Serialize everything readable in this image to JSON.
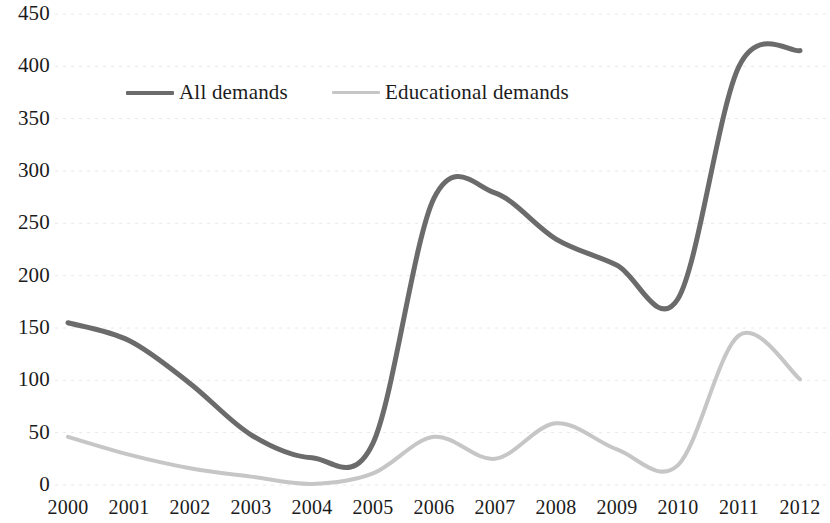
{
  "chart_data": {
    "type": "line",
    "title": "",
    "xlabel": "",
    "ylabel": "",
    "categories": [
      "2000",
      "2001",
      "2002",
      "2003",
      "2004",
      "2005",
      "2006",
      "2007",
      "2008",
      "2009",
      "2010",
      "2011",
      "2012"
    ],
    "x": [
      2000,
      2001,
      2002,
      2003,
      2004,
      2005,
      2006,
      2007,
      2008,
      2009,
      2010,
      2011,
      2012
    ],
    "xlim": [
      2000,
      2012
    ],
    "ylim": [
      0,
      450
    ],
    "y_ticks": [
      0,
      50,
      100,
      150,
      200,
      250,
      300,
      350,
      400,
      450
    ],
    "x_ticks": [
      "2000",
      "2001",
      "2002",
      "2003",
      "2004",
      "2005",
      "2006",
      "2007",
      "2008",
      "2009",
      "2010",
      "2011",
      "2012"
    ],
    "grid": true,
    "grid_style": "dotted-horizontal-faint",
    "legend_position": "upper-left-inside",
    "series": [
      {
        "name": "All demands",
        "color": "#6b6b6b",
        "line_width": 5,
        "values": [
          155,
          138,
          97,
          48,
          26,
          40,
          274,
          279,
          235,
          210,
          178,
          400,
          415
        ]
      },
      {
        "name": "Educational demands",
        "color": "#c6c6c6",
        "line_width": 4,
        "values": [
          46,
          29,
          16,
          8,
          1,
          11,
          46,
          25,
          59,
          34,
          19,
          143,
          101
        ]
      }
    ]
  },
  "legend": {
    "items": [
      {
        "label": "All demands",
        "swatch": "line-swatch-dark"
      },
      {
        "label": "Educational demands",
        "swatch": "line-swatch-light"
      }
    ]
  },
  "axes": {
    "y_labels": [
      "450",
      "400",
      "350",
      "300",
      "250",
      "200",
      "150",
      "100",
      "50",
      "0"
    ],
    "x_labels": [
      "2000",
      "2001",
      "2002",
      "2003",
      "2004",
      "2005",
      "2006",
      "2007",
      "2008",
      "2009",
      "2010",
      "2011",
      "2012"
    ]
  },
  "colors": {
    "series_all_demands": "#6b6b6b",
    "series_educational_demands": "#c6c6c6",
    "grid": "#e8e8e8",
    "text": "#1b1b1b",
    "background": "#ffffff"
  }
}
